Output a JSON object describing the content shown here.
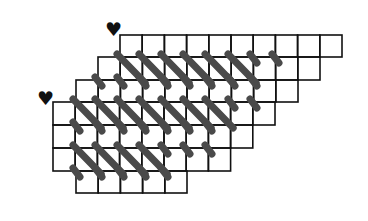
{
  "diagram": {
    "cell_size": 22.2,
    "origin_x": 53,
    "colors": {
      "grid": "#111111",
      "stitch": "#4a4a4a",
      "marker": "#111111",
      "background": "#ffffff"
    },
    "rows": [
      {
        "top": 35,
        "bottom": 57,
        "left": 120,
        "cells": 10
      },
      {
        "top": 57,
        "bottom": 80,
        "left": 98,
        "cells": 10
      },
      {
        "top": 80,
        "bottom": 102,
        "left": 76,
        "cells": 10
      },
      {
        "top": 102,
        "bottom": 125,
        "left": 53,
        "cells": 10
      },
      {
        "top": 125,
        "bottom": 148,
        "left": 53,
        "cells": 9
      },
      {
        "top": 148,
        "bottom": 171,
        "left": 53,
        "cells": 8
      },
      {
        "top": 171,
        "bottom": 193,
        "left": 76,
        "cells": 5
      }
    ],
    "stitch_rows": [
      {
        "top": 57,
        "bottom": 80,
        "full_starts": [
          120,
          142,
          164,
          186,
          208,
          231
        ],
        "stub_starts": [
          253,
          275
        ]
      },
      {
        "top": 80,
        "bottom": 102,
        "full_starts": [],
        "stub_starts": [
          98,
          120,
          142,
          164,
          186,
          208,
          231,
          253
        ]
      },
      {
        "top": 102,
        "bottom": 125,
        "full_starts": [
          76,
          98,
          120,
          142,
          164,
          186,
          208
        ],
        "stub_starts": [
          231,
          253
        ]
      },
      {
        "top": 125,
        "bottom": 148,
        "full_starts": [],
        "stub_starts": [
          76,
          98,
          120,
          142,
          164,
          186,
          208
        ]
      },
      {
        "top": 148,
        "bottom": 171,
        "full_starts": [
          76,
          98,
          120,
          142
        ],
        "stub_starts": [
          164,
          186,
          208
        ]
      },
      {
        "top": 171,
        "bottom": 193,
        "full_starts": [],
        "stub_starts": [
          76,
          98,
          120,
          142,
          164
        ]
      }
    ],
    "markers": [
      {
        "symbol": "♥",
        "label": "start-marker-top",
        "x": 105,
        "y": 20
      },
      {
        "symbol": "♥",
        "label": "start-marker-left",
        "x": 37,
        "y": 89
      }
    ]
  }
}
